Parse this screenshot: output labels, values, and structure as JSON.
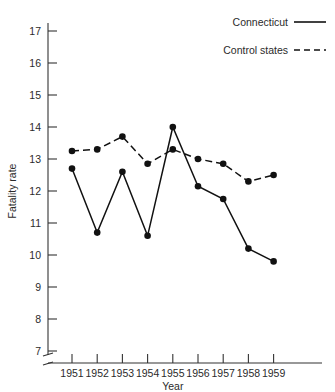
{
  "chart_data": {
    "type": "line",
    "title": "",
    "xlabel": "Year",
    "ylabel": "Fatality rate",
    "x": [
      1951,
      1952,
      1953,
      1954,
      1955,
      1956,
      1957,
      1958,
      1959
    ],
    "xtick_labels": [
      "1951",
      "1952",
      "1953",
      "1954",
      "1955",
      "1956",
      "1957",
      "1958",
      "1959"
    ],
    "ytick_labels": [
      "7",
      "8",
      "9",
      "10",
      "11",
      "12",
      "13",
      "14",
      "15",
      "16",
      "17"
    ],
    "yticks": [
      7,
      8,
      9,
      10,
      11,
      12,
      13,
      14,
      15,
      16,
      17
    ],
    "ylim": [
      6.6,
      17.4
    ],
    "xlim": [
      1950.5,
      1959.5
    ],
    "grid": false,
    "axis_break": true,
    "legend_position": "top-right",
    "series": [
      {
        "name": "Connecticut",
        "style": "solid",
        "marker": "filled-circle",
        "values": [
          12.7,
          10.7,
          12.6,
          10.6,
          14.0,
          12.15,
          11.75,
          10.2,
          9.8
        ]
      },
      {
        "name": "Control states",
        "style": "dashed",
        "marker": "filled-circle",
        "values": [
          13.25,
          13.3,
          13.7,
          12.85,
          13.3,
          13.0,
          12.85,
          12.3,
          12.5
        ]
      }
    ]
  },
  "legend": {
    "items": [
      {
        "label": "Connecticut",
        "style": "solid"
      },
      {
        "label": "Control states",
        "style": "dashed"
      }
    ]
  },
  "axes": {
    "x_title": "Year",
    "y_title": "Fatality rate"
  }
}
